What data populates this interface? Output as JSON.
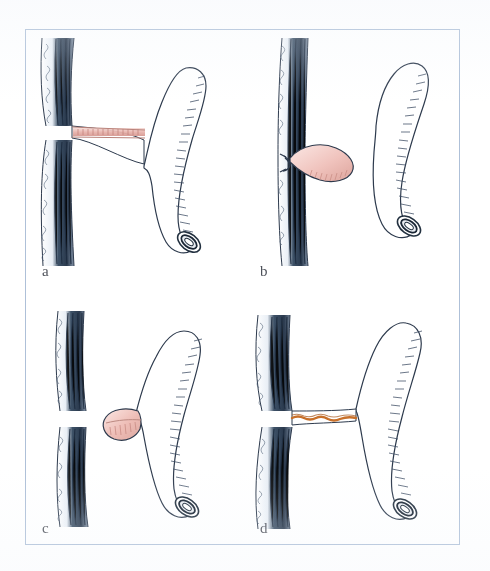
{
  "figure": {
    "caption": "",
    "frame_color": "#aec0d8",
    "background": "#ffffff",
    "panels": [
      {
        "id": "a",
        "label": "a",
        "description": "Appendix attached to bowel wall by a thin narrow base; crushed and ligated line shown in pink across the base",
        "stump_color": "#e8b4ad",
        "ink_color": "#2d3a4d",
        "wall_color": "#24344a"
      },
      {
        "id": "b",
        "label": "b",
        "description": "Ligated appendiceal stump remaining as a pink teardrop bulb tied at the bowel wall, appendix removed and shown separately",
        "stump_color": "#f0c3bd",
        "ink_color": "#2d3a4d",
        "wall_color": "#24344a"
      },
      {
        "id": "c",
        "label": "c",
        "description": "Appendix detached from the bowel wall with a rounded pink hatched stump at its base; a defect remains in the wall",
        "stump_color": "#eebdb6",
        "ink_color": "#2d3a4d",
        "wall_color": "#24344a"
      },
      {
        "id": "d",
        "label": "d",
        "description": "Appendix base divided with an orange cauterised / diathermy line joining wall to appendix",
        "stump_color": "#c8702a",
        "ink_color": "#2d3a4d",
        "wall_color": "#24344a"
      }
    ]
  }
}
